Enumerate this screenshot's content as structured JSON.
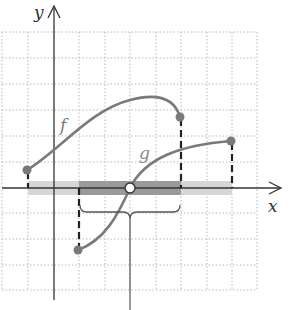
{
  "figure": {
    "axis_labels": {
      "x": "x",
      "y": "y"
    },
    "curve_labels": {
      "f": "f",
      "g": "g"
    },
    "colors": {
      "grid": "#b8b8b8",
      "axis": "#333333",
      "curve": "#7a7a7a",
      "point": "#7a7a7a",
      "dashed": "#222222",
      "band_light": "#d6d6d6",
      "band_dark": "#9a9a9a",
      "brace": "#555555"
    },
    "grid": {
      "x_min": -2,
      "x_max": 8,
      "y_min": -4,
      "y_max": 6,
      "step": 1
    },
    "curves": [
      {
        "name": "f",
        "start": [
          -1,
          0.7
        ],
        "end": [
          5,
          2.8
        ],
        "endpoints": "closed"
      },
      {
        "name": "g",
        "start": [
          1,
          -2.4
        ],
        "end": [
          7,
          1.8
        ],
        "endpoints": "closed",
        "zero_crossing": [
          3,
          0
        ]
      }
    ],
    "domain_bands": [
      {
        "name": "domain-f",
        "from": -1,
        "to": 5
      },
      {
        "name": "domain-g",
        "from": 1,
        "to": 7
      },
      {
        "name": "intersection",
        "from": 1,
        "to": 5
      }
    ],
    "excluded_point": {
      "x": 3,
      "y": 0,
      "style": "open-circle"
    },
    "brace": {
      "from": 1,
      "to": 5
    }
  }
}
